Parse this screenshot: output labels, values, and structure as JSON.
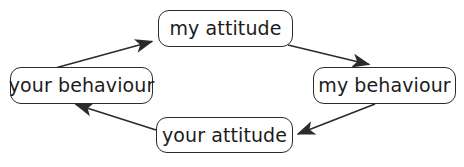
{
  "diagram": {
    "type": "cycle-diagram",
    "stroke_color": "#2b2b2b",
    "text_color": "#1c1c1c",
    "background_color": "#ffffff",
    "nodes": [
      {
        "id": "my-attitude",
        "label": "my attitude"
      },
      {
        "id": "my-behaviour",
        "label": "my behaviour"
      },
      {
        "id": "your-attitude",
        "label": "your attitude"
      },
      {
        "id": "your-behaviour",
        "label": "your behaviour"
      }
    ],
    "edges": [
      {
        "id": "edge-your-behaviour-to-my-attitude",
        "from": "your-behaviour",
        "to": "my-attitude",
        "arrowhead": "end"
      },
      {
        "id": "edge-my-attitude-to-my-behaviour",
        "from": "my-attitude",
        "to": "my-behaviour",
        "arrowhead": "end"
      },
      {
        "id": "edge-my-behaviour-to-your-attitude",
        "from": "my-behaviour",
        "to": "your-attitude",
        "arrowhead": "end"
      },
      {
        "id": "edge-your-attitude-to-your-behaviour",
        "from": "your-attitude",
        "to": "your-behaviour",
        "arrowhead": "end"
      }
    ]
  }
}
